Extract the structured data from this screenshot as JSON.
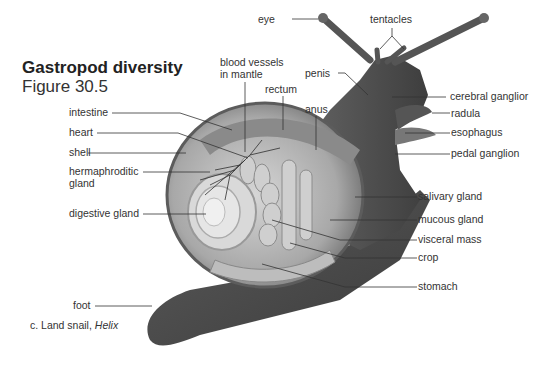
{
  "header": {
    "title": "Gastropod diversity",
    "subtitle": "Figure 30.5"
  },
  "caption": {
    "prefix": "c. Land snail, ",
    "genus": "Helix"
  },
  "labels": {
    "eye": "eye",
    "tentacles": "tentacles",
    "blood_vessels_1": "blood vessels",
    "blood_vessels_2": "in mantle",
    "rectum": "rectum",
    "anus": "anus",
    "penis": "penis",
    "cerebral_ganglion": "cerebral ganglior",
    "radula": "radula",
    "esophagus": "esophagus",
    "pedal_ganglion": "pedal ganglion",
    "salivary_gland": "salivary gland",
    "mucous_gland": "mucous gland",
    "visceral_mass": "visceral mass",
    "crop": "crop",
    "stomach": "stomach",
    "intestine": "intestine",
    "heart": "heart",
    "shell": "shell",
    "hermaphroditic_1": "hermaphroditic",
    "hermaphroditic_2": "gland",
    "digestive_gland": "digestive gland",
    "foot": "foot"
  },
  "colors": {
    "body_dark": "#4a4a4a",
    "body_mid": "#6e6e6e",
    "shell_light": "#c8c8c8",
    "organ_light": "#bdbdbd",
    "leader": "#333333"
  }
}
